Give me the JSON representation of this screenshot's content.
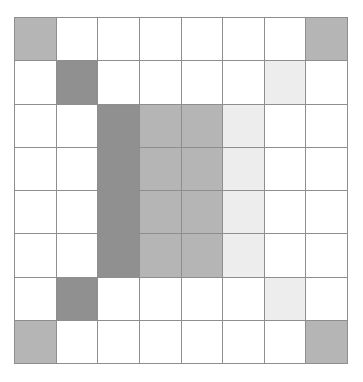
{
  "figure": {
    "title": "",
    "background_color": "#ffffff",
    "grid_line_color": "#8e8e8e",
    "grid_origin_x": 14,
    "grid_origin_y": 17,
    "grid_width": 334,
    "grid_height": 347
  },
  "palette": {
    "empty": "#ffffff",
    "very_light": "#ededed",
    "medium": "#b5b5b5",
    "dark": "#909090"
  },
  "chart_data": {
    "type": "heatmap",
    "title": "",
    "subtitle": "",
    "xlabel": "",
    "ylabel": "",
    "grid": true,
    "legend_position": "none",
    "rows": 8,
    "cols": 8,
    "x": [
      0,
      1,
      2,
      3,
      4,
      5,
      6,
      7
    ],
    "y": [
      0,
      1,
      2,
      3,
      4,
      5,
      6,
      7
    ],
    "xticklabels": [
      "",
      "",
      "",
      "",
      "",
      "",
      "",
      ""
    ],
    "yticklabels": [
      "",
      "",
      "",
      "",
      "",
      "",
      "",
      ""
    ],
    "value_labels": {
      "0": "empty",
      "1": "very light",
      "2": "medium",
      "3": "dark"
    },
    "colorscale": [
      "#ffffff",
      "#ededed",
      "#b5b5b5",
      "#909090"
    ],
    "zlim": [
      0,
      3
    ],
    "values": [
      [
        2,
        0,
        0,
        0,
        0,
        0,
        0,
        2
      ],
      [
        0,
        3,
        0,
        0,
        0,
        0,
        1,
        0
      ],
      [
        0,
        0,
        3,
        2,
        2,
        1,
        0,
        0
      ],
      [
        0,
        0,
        3,
        2,
        2,
        1,
        0,
        0
      ],
      [
        0,
        0,
        3,
        2,
        2,
        1,
        0,
        0
      ],
      [
        0,
        0,
        3,
        2,
        2,
        1,
        0,
        0
      ],
      [
        0,
        3,
        0,
        0,
        0,
        0,
        1,
        0
      ],
      [
        2,
        0,
        0,
        0,
        0,
        0,
        0,
        2
      ]
    ],
    "cell_colors": [
      [
        "#b5b5b5",
        "#ffffff",
        "#ffffff",
        "#ffffff",
        "#ffffff",
        "#ffffff",
        "#ffffff",
        "#b5b5b5"
      ],
      [
        "#ffffff",
        "#909090",
        "#ffffff",
        "#ffffff",
        "#ffffff",
        "#ffffff",
        "#ededed",
        "#ffffff"
      ],
      [
        "#ffffff",
        "#ffffff",
        "#909090",
        "#b5b5b5",
        "#b5b5b5",
        "#ededed",
        "#ffffff",
        "#ffffff"
      ],
      [
        "#ffffff",
        "#ffffff",
        "#909090",
        "#b5b5b5",
        "#b5b5b5",
        "#ededed",
        "#ffffff",
        "#ffffff"
      ],
      [
        "#ffffff",
        "#ffffff",
        "#909090",
        "#b5b5b5",
        "#b5b5b5",
        "#ededed",
        "#ffffff",
        "#ffffff"
      ],
      [
        "#ffffff",
        "#ffffff",
        "#909090",
        "#b5b5b5",
        "#b5b5b5",
        "#ededed",
        "#ffffff",
        "#ffffff"
      ],
      [
        "#ffffff",
        "#909090",
        "#ffffff",
        "#ffffff",
        "#ffffff",
        "#ffffff",
        "#ededed",
        "#ffffff"
      ],
      [
        "#b5b5b5",
        "#ffffff",
        "#ffffff",
        "#ffffff",
        "#ffffff",
        "#ffffff",
        "#ffffff",
        "#b5b5b5"
      ]
    ]
  }
}
